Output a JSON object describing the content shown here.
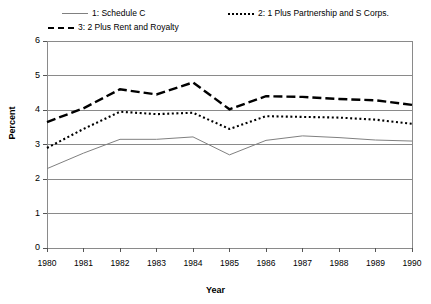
{
  "chart_data": {
    "type": "line",
    "title": "",
    "xlabel": "Year",
    "ylabel": "Percent",
    "x": [
      1980,
      1981,
      1982,
      1983,
      1984,
      1985,
      1986,
      1987,
      1988,
      1989,
      1990
    ],
    "categories": [
      "1980",
      "1981",
      "1982",
      "1983",
      "1984",
      "1985",
      "1986",
      "1987",
      "1988",
      "1989",
      "1990"
    ],
    "xlim": [
      1980,
      1990
    ],
    "ylim": [
      0,
      6
    ],
    "yticks": [
      0,
      1,
      2,
      3,
      4,
      5,
      6
    ],
    "ytick_labels": [
      "0",
      "1",
      "2",
      "3",
      "4",
      "5",
      "6"
    ],
    "grid": true,
    "legend_position": "top",
    "series": [
      {
        "name": "1: Schedule C",
        "style": "solid",
        "color": "#808080",
        "values": [
          2.3,
          2.75,
          3.15,
          3.15,
          3.22,
          2.7,
          3.12,
          3.25,
          3.2,
          3.13,
          3.1
        ]
      },
      {
        "name": "2: 1 Plus Partnership and S Corps.",
        "style": "dotted",
        "color": "#000000",
        "values": [
          2.9,
          3.45,
          3.95,
          3.88,
          3.92,
          3.45,
          3.82,
          3.8,
          3.78,
          3.72,
          3.6
        ]
      },
      {
        "name": "3: 2 Plus Rent and Royalty",
        "style": "dashed",
        "color": "#000000",
        "values": [
          3.65,
          4.05,
          4.6,
          4.45,
          4.8,
          4.02,
          4.4,
          4.38,
          4.32,
          4.28,
          4.15
        ]
      }
    ]
  },
  "legend": {
    "entries": [
      {
        "label": "1: Schedule C"
      },
      {
        "label": "2: 1 Plus Partnership and S Corps."
      },
      {
        "label": "3: 2 Plus Rent and Royalty"
      }
    ]
  },
  "axes": {
    "y_title": "Percent",
    "x_title": "Year"
  }
}
